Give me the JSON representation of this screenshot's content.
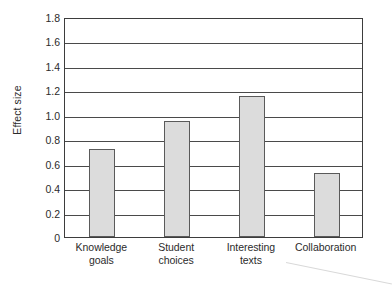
{
  "chart_data": {
    "type": "bar",
    "title": "",
    "xlabel": "",
    "ylabel": "Effect size",
    "categories": [
      "Knowledge goals",
      "Student choices",
      "Interesting texts",
      "Collaboration"
    ],
    "category_lines": [
      [
        "Knowledge",
        "goals"
      ],
      [
        "Student",
        "choices"
      ],
      [
        "Interesting",
        "texts"
      ],
      [
        "Collaboration"
      ]
    ],
    "values": [
      0.72,
      0.95,
      1.15,
      0.52
    ],
    "ylim": [
      0,
      1.8
    ],
    "ytick_labels": [
      "0",
      "0.2",
      "0.4",
      "0.6",
      "0.8",
      "1.0",
      "1.2",
      "1.4",
      "1.6",
      "1.8"
    ],
    "ytick_values": [
      0,
      0.2,
      0.4,
      0.6,
      0.8,
      1.0,
      1.2,
      1.4,
      1.6,
      1.8
    ],
    "grid": true,
    "grid_axis": "y",
    "legend": null,
    "legend_position": "none",
    "bar_fill_color": "#dcdcdc",
    "bar_edge_color": "#5a5a5a",
    "grid_color": "#4a4a4a",
    "frame_color": "#3d3d3d",
    "text_color": "#2b2b2b",
    "background_color": "#ffffff"
  }
}
